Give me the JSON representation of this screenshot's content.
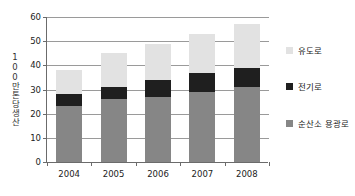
{
  "chart_data": {
    "type": "bar",
    "stacked": true,
    "title": "",
    "subtitle": "",
    "xlabel": "",
    "ylabel": "100만톤당생산",
    "categories": [
      "2004",
      "2005",
      "2006",
      "2007",
      "2008"
    ],
    "series": [
      {
        "name": "순산소 용광로",
        "color": "#868686",
        "values": [
          23,
          26,
          27,
          29,
          31
        ]
      },
      {
        "name": "전기로",
        "color": "#1f1f1f",
        "values": [
          5,
          5,
          7,
          8,
          8
        ]
      },
      {
        "name": "유도로",
        "color": "#e2e2e2",
        "values": [
          10,
          14,
          15,
          16,
          18
        ]
      }
    ],
    "totals": [
      38,
      45,
      49,
      53,
      57
    ],
    "ylim": [
      0,
      60
    ],
    "yticks": [
      0,
      10,
      20,
      30,
      40,
      50,
      60
    ],
    "ytick_labels": [
      "0",
      "10",
      "20",
      "30",
      "40",
      "50",
      "60"
    ],
    "grid": true,
    "legend_position": "right",
    "legend_order_top_to_bottom": [
      "유도로",
      "전기로",
      "순산소 용광로"
    ]
  },
  "legend": {
    "items": [
      {
        "label": "유도로",
        "color": "#e2e2e2"
      },
      {
        "label": "전기로",
        "color": "#1f1f1f"
      },
      {
        "label": "순산소 용광로",
        "color": "#868686"
      }
    ]
  },
  "axes": {
    "y_title": "100만톤당생산",
    "y_tick_labels": [
      "60",
      "50",
      "40",
      "30",
      "20",
      "10",
      "0"
    ],
    "x_tick_labels": [
      "2004",
      "2005",
      "2006",
      "2007",
      "2008"
    ]
  },
  "colors": {
    "axis": "#6b6b6b",
    "grid": "#9a9a9a",
    "text": "#222222",
    "background": "#ffffff"
  }
}
